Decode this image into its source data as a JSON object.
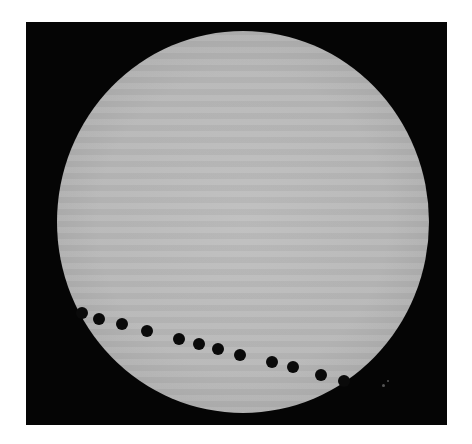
{
  "image": {
    "description": "Composite photograph of a planetary transit across the Sun: a bright gray solar disc on a black background with a sequence of black dots marking the planet's path along the lower part of the disc.",
    "background_color": "#050505",
    "page_color": "#ffffff",
    "sun": {
      "cx": 243,
      "cy": 222,
      "rx": 186,
      "ry": 191,
      "color": "#b9b9b9"
    },
    "transit_points": [
      {
        "x": 82,
        "y": 313,
        "r": 6
      },
      {
        "x": 99,
        "y": 319,
        "r": 6
      },
      {
        "x": 122,
        "y": 324,
        "r": 6
      },
      {
        "x": 147,
        "y": 331,
        "r": 6
      },
      {
        "x": 179,
        "y": 339,
        "r": 6
      },
      {
        "x": 199,
        "y": 344,
        "r": 6
      },
      {
        "x": 218,
        "y": 349,
        "r": 6
      },
      {
        "x": 240,
        "y": 355,
        "r": 6
      },
      {
        "x": 272,
        "y": 362,
        "r": 6
      },
      {
        "x": 293,
        "y": 367,
        "r": 6
      },
      {
        "x": 321,
        "y": 375,
        "r": 6
      },
      {
        "x": 344,
        "y": 381,
        "r": 6
      }
    ]
  }
}
